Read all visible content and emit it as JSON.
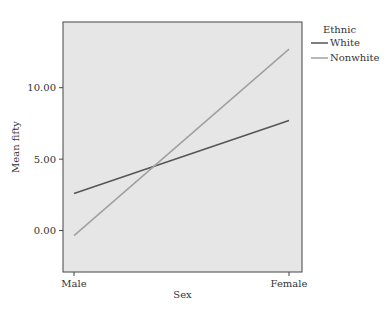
{
  "chart_data": {
    "type": "line",
    "title": "",
    "xlabel": "Sex",
    "ylabel": "Mean fifty",
    "categories": [
      "Male",
      "Female"
    ],
    "yticks": [
      0,
      5,
      10
    ],
    "ytick_labels": [
      "0.00",
      "5.00",
      "10.00"
    ],
    "ylim": [
      -2.9,
      14.6
    ],
    "grid": false,
    "legend": {
      "title": "Ethnic",
      "placement": "top-right-outside"
    },
    "series": [
      {
        "name": "White",
        "values": [
          2.6,
          7.7
        ],
        "color": "#555555"
      },
      {
        "name": "Nonwhite",
        "values": [
          -0.35,
          12.7
        ],
        "color": "#a0a0a0"
      }
    ],
    "plot_background": "#e6e6e6"
  }
}
